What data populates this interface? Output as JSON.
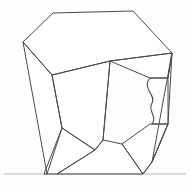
{
  "figure": {
    "background_color": "#fdfdfd",
    "line_color": "#4a4a4a",
    "ground_color": "#b9b9b9",
    "face_fill": "#ffffff"
  },
  "geometry": {
    "canvas": {
      "width": 190,
      "height": 192
    },
    "vertices": {
      "top_left_apex": [
        53,
        13
      ],
      "top_right_apex": [
        133,
        11
      ],
      "left_upper_apex": [
        23,
        42
      ],
      "left_mid_junction": [
        52,
        75
      ],
      "center_junction": [
        110,
        61
      ],
      "right_shoulder": [
        172,
        53
      ],
      "notch_top": [
        150,
        78
      ],
      "notch_bottom": [
        152,
        124
      ],
      "right_notch_edge_top": [
        168,
        78
      ],
      "right_notch_edge_bottom": [
        168,
        124
      ],
      "left_lower_point": [
        47,
        174
      ],
      "left_inner_point": [
        44,
        174
      ],
      "lower_left_bend": [
        62,
        128
      ],
      "lower_center_junction": [
        95,
        150
      ],
      "bottom_mid_foot": [
        57,
        174
      ],
      "lower_right_bend": [
        122,
        144
      ],
      "right_foot": [
        143,
        174
      ],
      "right_outer_foot": [
        152,
        162
      ]
    },
    "paths": {
      "top_facet": "M 23 42 L 53 13 L 133 11 L 172 53 L 110 61 L 52 75 Z",
      "left_facet": "M 23 42 L 52 75 L 62 128 L 47 174 Z",
      "left_inner_facet": "M 52 75 L 110 61 L 103 140 L 95 150 L 62 128 Z",
      "lower_left_facet": "M 62 128 L 95 150 L 57 174 L 44 174 Z",
      "lower_center_facet": "M 95 150 L 103 140 L 122 144 L 143 174 L 57 174 Z",
      "right_upper_facet": "M 110 61 L 172 53 L 168 78 L 150 78 Z",
      "right_lower_facet": "M 150 124 L 168 124 L 152 162 L 143 174 L 122 144 Z",
      "right_side_facet": "M 172 53 L 168 78 L 168 124 L 152 162 Z",
      "center_vertical_edge": "M 110 61 L 103 140",
      "right_outer_edge": "M 172 53 L 168 124 L 152 162 L 143 174",
      "notch_s_curve": "M 150 78 C 141 88 157 96 152 103 C 147 111 158 116 152 124",
      "notch_top_edge": "M 150 78 L 168 78",
      "notch_bottom_edge": "M 152 124 L 168 124",
      "ground": "M 4 174 L 186 174"
    }
  },
  "labels": {
    "caption": ""
  }
}
